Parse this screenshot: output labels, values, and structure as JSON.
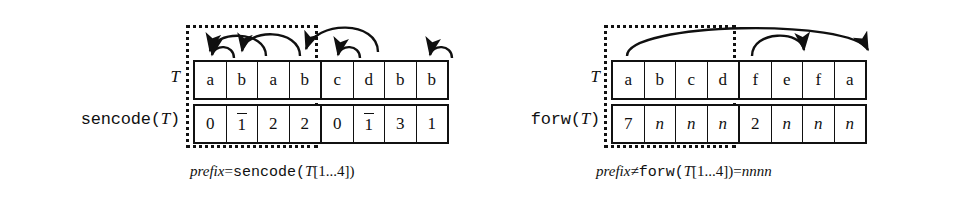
{
  "figure": {
    "type": "diagram",
    "background_color": "#ffffff",
    "ink_color": "#101010"
  },
  "panels": [
    {
      "id": "left",
      "labels": {
        "text_row": "T",
        "code_row_prefix": "sencode(",
        "code_row_arg": "T",
        "code_row_suffix": ")"
      },
      "text_cells": [
        "a",
        "b",
        "a",
        "b",
        "c",
        "d",
        "b",
        "b"
      ],
      "code_cells": [
        {
          "value": "0",
          "overbar": false
        },
        {
          "value": "1",
          "overbar": true
        },
        {
          "value": "2",
          "overbar": false
        },
        {
          "value": "2",
          "overbar": false
        },
        {
          "value": "0",
          "overbar": false
        },
        {
          "value": "1",
          "overbar": true
        },
        {
          "value": "3",
          "overbar": false
        },
        {
          "value": "1",
          "overbar": false
        }
      ],
      "split_after_index": 4,
      "caption": {
        "italic_word": "prefix",
        "relation": "=",
        "mono_word": "sencode(",
        "arg_italic": "T",
        "arg_rest": "[1...4])",
        "tail": ""
      },
      "arcs": [
        {
          "from_cell": 2,
          "to_cell": 1,
          "span": "short"
        },
        {
          "from_cell": 3,
          "to_cell": 1,
          "span": "long"
        },
        {
          "from_cell": 4,
          "to_cell": 2,
          "span": "long"
        },
        {
          "from_cell": 6,
          "to_cell": 5,
          "span": "short"
        },
        {
          "from_cell": 8,
          "to_cell": 7,
          "span": "short"
        },
        {
          "from_cell": 7,
          "to_cell": 4,
          "span": "long"
        }
      ]
    },
    {
      "id": "right",
      "labels": {
        "text_row": "T",
        "code_row_prefix": "forw(",
        "code_row_arg": "T",
        "code_row_suffix": ")"
      },
      "text_cells": [
        "a",
        "b",
        "c",
        "d",
        "f",
        "e",
        "f",
        "a"
      ],
      "code_cells": [
        {
          "value": "7",
          "overbar": false,
          "italic": false
        },
        {
          "value": "n",
          "overbar": false,
          "italic": true
        },
        {
          "value": "n",
          "overbar": false,
          "italic": true
        },
        {
          "value": "n",
          "overbar": false,
          "italic": true
        },
        {
          "value": "2",
          "overbar": false,
          "italic": false
        },
        {
          "value": "n",
          "overbar": false,
          "italic": true
        },
        {
          "value": "n",
          "overbar": false,
          "italic": true
        },
        {
          "value": "n",
          "overbar": false,
          "italic": true
        }
      ],
      "split_after_index": 4,
      "caption": {
        "italic_word": "prefix",
        "relation": "≠",
        "mono_word": "forw(",
        "arg_italic": "T",
        "arg_rest": "[1...4])=",
        "tail": "nnnn"
      },
      "arcs": [
        {
          "from_cell": 1,
          "to_cell": 8,
          "span": "long"
        },
        {
          "from_cell": 5,
          "to_cell": 7,
          "span": "short"
        }
      ]
    }
  ]
}
